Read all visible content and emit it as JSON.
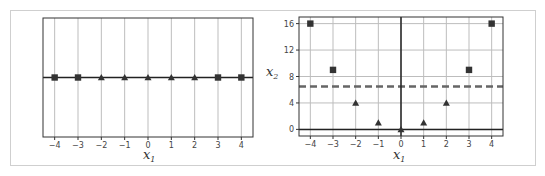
{
  "chart_data": [
    {
      "type": "scatter",
      "title": "",
      "xlabel": "x_1",
      "ylabel": "",
      "xlim": [
        -4.5,
        4.5
      ],
      "ylim": [
        -0.2,
        0.2
      ],
      "xticks": [
        -4,
        -3,
        -2,
        -1,
        0,
        1,
        2,
        3,
        4
      ],
      "xtick_labels": [
        "−4",
        "−3",
        "−2",
        "−1",
        "0",
        "1",
        "2",
        "3",
        "4"
      ],
      "yticks": [],
      "grid": true,
      "hlines": [
        {
          "y": 0,
          "style": "solid",
          "color": "#222222"
        }
      ],
      "series": [
        {
          "name": "class-square",
          "marker": "square",
          "x": [
            -4,
            -3,
            3,
            4
          ],
          "y": [
            0,
            0,
            0,
            0
          ]
        },
        {
          "name": "class-triangle",
          "marker": "triangle",
          "x": [
            -2,
            -1,
            0,
            1,
            2
          ],
          "y": [
            0,
            0,
            0,
            0,
            0
          ]
        }
      ]
    },
    {
      "type": "scatter",
      "title": "",
      "xlabel": "x_1",
      "ylabel": "x_2",
      "xlim": [
        -4.5,
        4.5
      ],
      "ylim": [
        -1,
        17
      ],
      "xticks": [
        -4,
        -3,
        -2,
        -1,
        0,
        1,
        2,
        3,
        4
      ],
      "xtick_labels": [
        "−4",
        "−3",
        "−2",
        "−1",
        "0",
        "1",
        "2",
        "3",
        "4"
      ],
      "yticks": [
        0,
        4,
        8,
        12,
        16
      ],
      "ytick_labels": [
        "0",
        "4",
        "8",
        "12",
        "16"
      ],
      "grid": true,
      "hlines": [
        {
          "y": 0,
          "style": "solid",
          "color": "#222222"
        },
        {
          "y": 6.5,
          "style": "dashed",
          "color": "#666666"
        }
      ],
      "vlines": [
        {
          "x": 0,
          "style": "solid",
          "color": "#222222"
        }
      ],
      "series": [
        {
          "name": "class-square",
          "marker": "square",
          "x": [
            -4,
            -3,
            3,
            4
          ],
          "y": [
            16,
            9,
            9,
            16
          ]
        },
        {
          "name": "class-triangle",
          "marker": "triangle",
          "x": [
            -2,
            -1,
            0,
            1,
            2
          ],
          "y": [
            4,
            1,
            0,
            1,
            4
          ]
        }
      ]
    }
  ],
  "labels": {
    "left_xlabel_main": "x",
    "left_xlabel_sub": "1",
    "right_xlabel_main": "x",
    "right_xlabel_sub": "1",
    "right_ylabel_main": "x",
    "right_ylabel_sub": "2"
  },
  "colors": {
    "marker": "#333333",
    "grid": "#bdbdbd",
    "axis_line": "#222222",
    "dashed": "#666666",
    "frame": "#cfcfcf"
  }
}
